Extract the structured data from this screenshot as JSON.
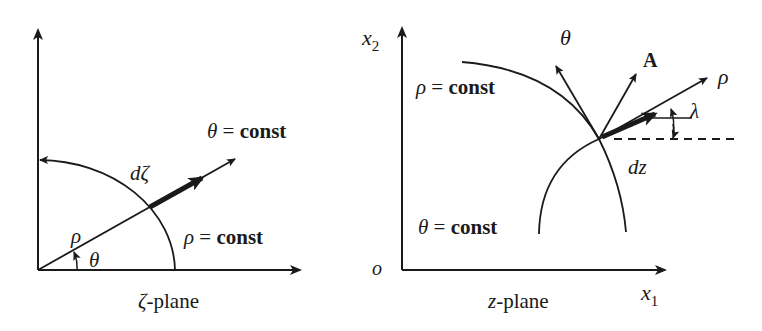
{
  "left_panel": {
    "caption_symbol": "ζ",
    "caption_text": "-plane",
    "theta_const_label": {
      "symbol": "θ",
      "eq": " = ",
      "value": "const"
    },
    "rho_const_label": {
      "symbol": "ρ",
      "eq": " = ",
      "value": "const"
    },
    "d_zeta_label": "dζ",
    "rho_label": "ρ",
    "theta_label": "θ"
  },
  "right_panel": {
    "caption_symbol": "z",
    "caption_text": "-plane",
    "x2_label": {
      "base": "x",
      "sub": "2"
    },
    "x1_label": {
      "base": "x",
      "sub": "1"
    },
    "origin_label": "o",
    "rho_const_label": {
      "symbol": "ρ",
      "eq": " = ",
      "value": "const"
    },
    "theta_const_label": {
      "symbol": "θ",
      "eq": " = ",
      "value": "const"
    },
    "theta_arrow_label": "θ",
    "A_arrow_label": "A",
    "rho_arrow_label": "ρ",
    "lambda_label": "λ",
    "dz_label": "dz"
  },
  "colors": {
    "stroke": "#1a1a1a",
    "background": "#ffffff"
  }
}
